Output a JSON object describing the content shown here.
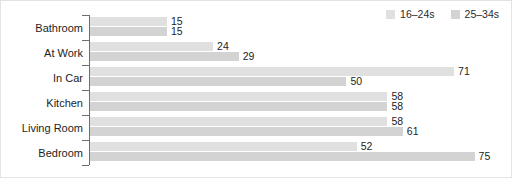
{
  "chart_data": {
    "type": "bar",
    "orientation": "horizontal",
    "grouped": true,
    "title": "",
    "xlabel": "",
    "ylabel": "",
    "xlim": [
      0,
      78
    ],
    "grid": false,
    "legend_position": "top-right",
    "categories": [
      "Bathroom",
      "At Work",
      "In Car",
      "Kitchen",
      "Living Room",
      "Bedroom"
    ],
    "series": [
      {
        "name": "16–24s",
        "color": "#e0e0e0",
        "values": [
          15,
          24,
          71,
          58,
          58,
          52
        ]
      },
      {
        "name": "25–34s",
        "color": "#d3d3d3",
        "values": [
          15,
          29,
          50,
          58,
          61,
          75
        ]
      }
    ]
  },
  "legend": {
    "entries": [
      {
        "label": "16–24s",
        "swatch_color": "#e0e0e0"
      },
      {
        "label": "25–34s",
        "swatch_color": "#d3d3d3"
      }
    ]
  },
  "axis": {
    "line_color": "#6e6e6e",
    "tick_count": 7
  },
  "frame": {
    "background": "#ffffff",
    "border_color": "#e3e3e3"
  }
}
